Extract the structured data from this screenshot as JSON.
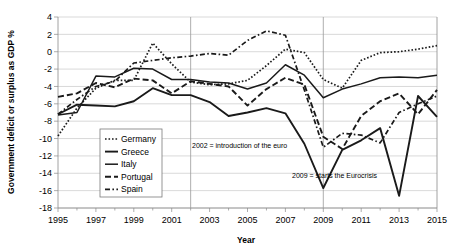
{
  "chart_data": {
    "type": "line",
    "title": "",
    "xlabel": "Year",
    "ylabel": "Government deficit or surplus as GDP %",
    "xlim": [
      1995,
      2015
    ],
    "ylim": [
      -18,
      4
    ],
    "ytick_step": 2,
    "grid": true,
    "legend_position": "inside-left",
    "x": [
      1995,
      1996,
      1997,
      1998,
      1999,
      2000,
      2001,
      2002,
      2003,
      2004,
      2005,
      2006,
      2007,
      2008,
      2009,
      2010,
      2011,
      2012,
      2013,
      2014,
      2015
    ],
    "xtick_labels": [
      "1995",
      "1997",
      "1999",
      "2001",
      "2003",
      "2005",
      "2007",
      "2009",
      "2011",
      "2013",
      "2015"
    ],
    "ytick_labels": [
      "4",
      "2",
      "0",
      "-2",
      "-4",
      "-6",
      "-8",
      "-10",
      "-12",
      "-14",
      "-16",
      "-18"
    ],
    "series": [
      {
        "name": "Germany",
        "style": "dotted",
        "values": [
          -9.7,
          -6.5,
          -4.2,
          -3.3,
          -3.3,
          1.0,
          -1.4,
          -3.5,
          -3.8,
          -3.7,
          -3.3,
          -1.6,
          0.3,
          -0.1,
          -3.2,
          -4.2,
          -1.0,
          -0.1,
          0.0,
          0.3,
          0.7
        ]
      },
      {
        "name": "Greece",
        "style": "solid-thick",
        "values": [
          -7.2,
          -6.1,
          -6.2,
          -6.3,
          -5.7,
          -4.2,
          -5.0,
          -5.0,
          -5.8,
          -7.4,
          -7.0,
          -6.5,
          -7.1,
          -10.6,
          -15.7,
          -11.3,
          -10.2,
          -8.8,
          -16.6,
          -5.1,
          -7.5
        ]
      },
      {
        "name": "Italy",
        "style": "solid-thin",
        "values": [
          -7.3,
          -7.0,
          -2.8,
          -2.9,
          -1.9,
          -2.0,
          -3.2,
          -3.2,
          -3.5,
          -3.6,
          -4.3,
          -3.6,
          -1.5,
          -2.7,
          -5.3,
          -4.3,
          -3.7,
          -3.0,
          -2.9,
          -3.0,
          -2.7
        ]
      },
      {
        "name": "Portugal",
        "style": "dashed",
        "values": [
          -5.2,
          -4.8,
          -3.6,
          -4.1,
          -3.1,
          -3.3,
          -4.8,
          -3.4,
          -3.7,
          -4.0,
          -6.2,
          -4.3,
          -3.0,
          -3.8,
          -9.8,
          -11.2,
          -7.4,
          -5.7,
          -4.8,
          -7.2,
          -4.4
        ]
      },
      {
        "name": "Spain",
        "style": "dash-dot",
        "values": [
          -7.2,
          -5.5,
          -4.0,
          -3.4,
          -1.3,
          -1.0,
          -0.7,
          -0.5,
          -0.2,
          -0.4,
          1.3,
          2.4,
          1.9,
          -4.4,
          -11.0,
          -9.4,
          -9.6,
          -10.5,
          -7.0,
          -6.0,
          -5.1
        ]
      }
    ],
    "annotations": [
      {
        "name": "euro-introduction",
        "text": "2002 = introduction of the  euro",
        "at_x": 2002
      },
      {
        "name": "eurocrisis-start",
        "text": "2009 = starts the Eurocrisis",
        "at_x": 2009
      }
    ],
    "vlines": [
      2002,
      2009
    ]
  },
  "legend": {
    "items": [
      {
        "label": "Germany"
      },
      {
        "label": "Greece"
      },
      {
        "label": "Italy"
      },
      {
        "label": "Portugal"
      },
      {
        "label": "Spain"
      }
    ]
  },
  "colors": {
    "line": "#1a1a1a",
    "grid": "#c9c9c9",
    "axis": "#8a8a8a",
    "background": "#ffffff"
  }
}
